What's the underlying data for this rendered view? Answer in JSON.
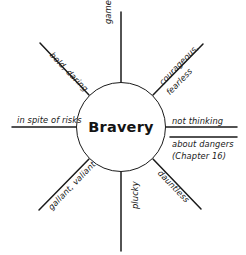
{
  "diagram": {
    "type": "word-web",
    "center": {
      "label": "Bravery",
      "shape": "circle"
    },
    "spokes": [
      {
        "id": "up",
        "label": "game, gritty",
        "direction": "north",
        "angle_deg": -90
      },
      {
        "id": "upper-right",
        "label": "courageous,",
        "label2": "fearless",
        "direction": "northeast",
        "angle_deg": -45
      },
      {
        "id": "right",
        "label": "not thinking",
        "label2": "about dangers",
        "label3": "(Chapter 16)",
        "direction": "east",
        "angle_deg": 0
      },
      {
        "id": "lower-right",
        "label": "dauntless",
        "direction": "southeast",
        "angle_deg": 45
      },
      {
        "id": "down",
        "label": "plucky",
        "direction": "south",
        "angle_deg": -90
      },
      {
        "id": "lower-left",
        "label": "gallant, valiant",
        "direction": "southwest",
        "angle_deg": -45
      },
      {
        "id": "left",
        "label": "in spite of risks",
        "direction": "west",
        "angle_deg": 0
      },
      {
        "id": "upper-left",
        "label": "bold, daring",
        "direction": "northwest",
        "angle_deg": 45
      }
    ],
    "colors": {
      "line": "#1a1a1a",
      "text": "#191919",
      "background": "#ffffff"
    }
  }
}
